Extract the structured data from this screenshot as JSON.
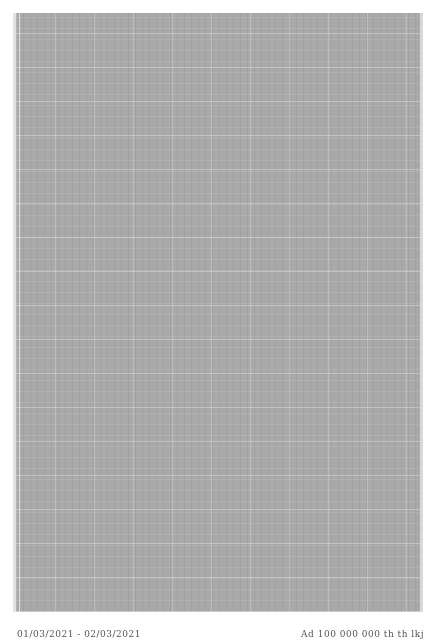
{
  "document": {
    "panel_color": "#a9a9a9",
    "background_color": "#ffffff"
  },
  "footer": {
    "left_text": "01/03/2021 - 02/03/2021",
    "right_text": "Ad 100 000 000 th th lkj"
  }
}
